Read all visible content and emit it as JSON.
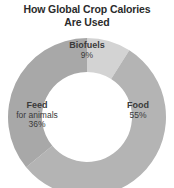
{
  "chart_data": {
    "type": "pie",
    "variant": "donut",
    "title": "How Global Crop Calories Are Used",
    "title_lines": [
      "How Global Crop Calories",
      "Are Used"
    ],
    "categories": [
      "Biofuels",
      "Food",
      "Feed for animals"
    ],
    "values": [
      9,
      55,
      36
    ],
    "unit": "%",
    "total": 100,
    "legend": "none",
    "grid": false,
    "xlabel": "",
    "ylabel": "",
    "slices": [
      {
        "name": "Biofuels",
        "sublabel": "",
        "value": 9,
        "pct_label": "9%",
        "color": "#d3d3d3",
        "start_angle": 0,
        "end_angle": 32.4
      },
      {
        "name": "Food",
        "sublabel": "",
        "value": 55,
        "pct_label": "55%",
        "color": "#b4b4b4",
        "start_angle": 32.4,
        "end_angle": 230.4
      },
      {
        "name": "Feed",
        "sublabel": "for animals",
        "value": 36,
        "pct_label": "36%",
        "color": "#a8a8a8",
        "start_angle": 230.4,
        "end_angle": 360
      }
    ]
  },
  "colors": {
    "background": "#ffffff",
    "title_text": "#2b2b2b",
    "label_text": "#3a3a3a",
    "hole": "#ffffff",
    "biofuels": "#d3d3d3",
    "food": "#b4b4b4",
    "feed": "#a8a8a8"
  }
}
